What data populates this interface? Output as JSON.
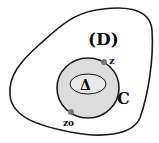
{
  "labels": {
    "domain": "(D)",
    "curve": "C",
    "inner_region": "Δ",
    "point_z": "z",
    "point_z0": "zo"
  },
  "colors": {
    "stroke": "#1a1a1a",
    "inner_fill": "#dcdcdc",
    "point_fill": "#777777"
  }
}
